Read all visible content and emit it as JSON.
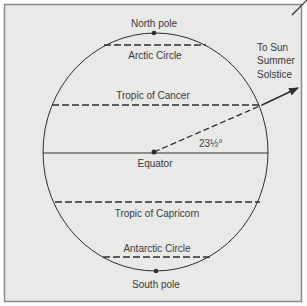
{
  "colors": {
    "page_bg": "#ffffff",
    "panel_bg": "#e9e9e7",
    "frame": "#8a8a8a",
    "ink": "#2e2e2e",
    "text": "#3a3a3a"
  },
  "diagram": {
    "labels": {
      "north_pole": "North pole",
      "arctic_circle": "Arctic Circle",
      "tropic_of_cancer": "Tropic of Cancer",
      "equator": "Equator",
      "tropic_of_capricorn": "Tropic of Capricorn",
      "antarctic_circle": "Antarctic Circle",
      "south_pole": "South pole",
      "sun_line1": "To Sun",
      "sun_line2": "Summer",
      "sun_line3": "Solstice",
      "angle": "23½°"
    },
    "parallels": [
      {
        "name": "Arctic Circle",
        "style": "dashed"
      },
      {
        "name": "Tropic of Cancer",
        "style": "dashed"
      },
      {
        "name": "Equator",
        "style": "solid"
      },
      {
        "name": "Tropic of Capricorn",
        "style": "dashed"
      },
      {
        "name": "Antarctic Circle",
        "style": "dashed"
      }
    ],
    "sun_ray_angle_deg": 23.5
  }
}
